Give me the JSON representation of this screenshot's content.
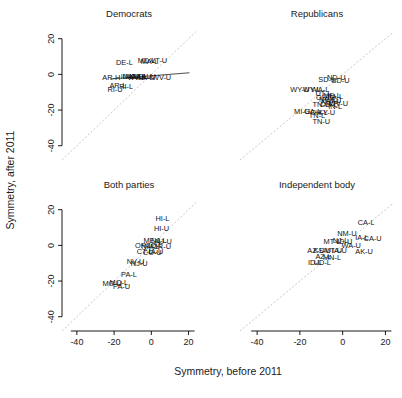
{
  "figure": {
    "axis_titles": {
      "x": "Symmetry, before 2011",
      "y": "Symmetry, after 2011"
    },
    "panel_titles": [
      "Democrats",
      "Republicans",
      "Both parties",
      "Independent body"
    ]
  },
  "chart_data": {
    "type": "scatter",
    "title": "",
    "subtitle": "",
    "xlabel": "Symmetry, before 2011",
    "ylabel": "Symmetry, after 2011",
    "xlim": [
      -48,
      24
    ],
    "ylim": [
      -48,
      26
    ],
    "xticks": [
      -40,
      -20,
      0,
      20
    ],
    "yticks": [
      -40,
      -20,
      0,
      20
    ],
    "xtick_labels": [
      "-40",
      "-20",
      "0",
      "20"
    ],
    "ytick_labels": [
      "-40",
      "-20",
      "0",
      "20"
    ],
    "grid": false,
    "legend": "none",
    "layout": "2x2 facet grid",
    "reference_line": {
      "type": "identity",
      "description": "y = x dashed grey diagonal",
      "color": "#b9b9b9"
    },
    "panels": [
      {
        "name": "Democrats",
        "fit_line": {
          "present": true,
          "x0": -22.0,
          "y0": -2.6,
          "x1": 20.5,
          "y1": 0.9,
          "color": "#3a3a3a"
        },
        "points": [
          {
            "label": "DE-L",
            "x": -14.5,
            "y": 5.0
          },
          {
            "label": "MD-L",
            "x": -2.5,
            "y": 6.2
          },
          {
            "label": "MA-L",
            "x": -1.0,
            "y": 6.0
          },
          {
            "label": "VT-U",
            "x": 4.0,
            "y": 6.4
          },
          {
            "label": "AR-H",
            "x": -21.5,
            "y": -3.4
          },
          {
            "label": "IL-L",
            "x": -13.0,
            "y": -2.6
          },
          {
            "label": "NV-L",
            "x": -11.0,
            "y": -2.4
          },
          {
            "label": "MA-U",
            "x": -9.0,
            "y": -2.6
          },
          {
            "label": "WV-L",
            "x": -8.0,
            "y": -3.0
          },
          {
            "label": "CA-L",
            "x": -6.5,
            "y": -2.8
          },
          {
            "label": "MD-U",
            "x": -5.0,
            "y": -2.6
          },
          {
            "label": "LA-L",
            "x": -3.0,
            "y": -3.0
          },
          {
            "label": "IL-U",
            "x": -1.5,
            "y": -2.4
          },
          {
            "label": "WV-U",
            "x": 5.5,
            "y": -3.4
          },
          {
            "label": "AR-L",
            "x": -18.0,
            "y": -7.4
          },
          {
            "label": "RI-L",
            "x": -13.5,
            "y": -8.0
          },
          {
            "label": "RI-U",
            "x": -19.5,
            "y": -9.6
          }
        ]
      },
      {
        "name": "Republicans",
        "fit_line": {
          "present": false
        },
        "points": [
          {
            "label": "ND-U",
            "x": -3.0,
            "y": -3.2
          },
          {
            "label": "SD-L",
            "x": -7.5,
            "y": -4.0
          },
          {
            "label": "SD-U",
            "x": -1.0,
            "y": -5.0
          },
          {
            "label": "WY-U",
            "x": -20.0,
            "y": -10.0
          },
          {
            "label": "WY-L",
            "x": -14.5,
            "y": -10.0
          },
          {
            "label": "WA-L",
            "x": -10.5,
            "y": -10.0
          },
          {
            "label": "UT-L",
            "x": -9.0,
            "y": -12.0
          },
          {
            "label": "OH-U",
            "x": -8.0,
            "y": -14.5
          },
          {
            "label": "ME-L",
            "x": -5.0,
            "y": -13.5
          },
          {
            "label": "PA-L",
            "x": -3.5,
            "y": -14.0
          },
          {
            "label": "NC-L",
            "x": -7.0,
            "y": -15.5
          },
          {
            "label": "KS-U",
            "x": -6.0,
            "y": -16.5
          },
          {
            "label": "WI-U",
            "x": -4.5,
            "y": -16.0
          },
          {
            "label": "WV-U",
            "x": -2.0,
            "y": -17.5
          },
          {
            "label": "TN-U",
            "x": -10.0,
            "y": -18.5
          },
          {
            "label": "OH-L",
            "x": -6.5,
            "y": -18.5
          },
          {
            "label": "IN-L",
            "x": -3.5,
            "y": -19.5
          },
          {
            "label": "MI-U",
            "x": -19.0,
            "y": -22.0
          },
          {
            "label": "GA-L",
            "x": -14.0,
            "y": -22.0
          },
          {
            "label": "OH-L2",
            "x": -11.0,
            "y": -22.5
          },
          {
            "label": "KY-U",
            "x": -7.5,
            "y": -22.5
          },
          {
            "label": "TN-L",
            "x": -12.0,
            "y": -24.5
          },
          {
            "label": "TN-U2",
            "x": -10.0,
            "y": -28.0
          }
        ]
      },
      {
        "name": "Both parties",
        "fit_line": {
          "present": false
        },
        "points": [
          {
            "label": "HI-L",
            "x": 6.0,
            "y": 13.5
          },
          {
            "label": "HI-U",
            "x": 5.5,
            "y": 8.0
          },
          {
            "label": "ME-L",
            "x": 0.5,
            "y": 1.5
          },
          {
            "label": "NJ-L",
            "x": 4.0,
            "y": 1.5
          },
          {
            "label": "NJ-U",
            "x": 6.5,
            "y": 0.6
          },
          {
            "label": "OR-L",
            "x": -4.0,
            "y": -1.5
          },
          {
            "label": "NM-L",
            "x": -0.5,
            "y": -1.8
          },
          {
            "label": "CO-L",
            "x": 1.5,
            "y": -1.6
          },
          {
            "label": "OR-U",
            "x": 5.5,
            "y": -1.8
          },
          {
            "label": "CT-L",
            "x": -3.5,
            "y": -5.0
          },
          {
            "label": "CO-U",
            "x": 0.5,
            "y": -5.2
          },
          {
            "label": "IA-U",
            "x": 2.5,
            "y": -5.0
          },
          {
            "label": "NV-U",
            "x": -8.5,
            "y": -10.5
          },
          {
            "label": "NJ-U2",
            "x": -6.5,
            "y": -11.5
          },
          {
            "label": "PA-L",
            "x": -12.0,
            "y": -17.5
          },
          {
            "label": "MO-U",
            "x": -21.0,
            "y": -22.5
          },
          {
            "label": "MO-L",
            "x": -17.5,
            "y": -22.0
          },
          {
            "label": "PA-U",
            "x": -16.0,
            "y": -24.5
          }
        ]
      },
      {
        "name": "Independent body",
        "fit_line": {
          "present": false
        },
        "points": [
          {
            "label": "CA-L",
            "x": 11.0,
            "y": 11.5
          },
          {
            "label": "NM-U",
            "x": 2.0,
            "y": 5.0
          },
          {
            "label": "CA-U",
            "x": 14.0,
            "y": 2.5
          },
          {
            "label": "IA-L",
            "x": 9.0,
            "y": 3.0
          },
          {
            "label": "MT-L",
            "x": -5.0,
            "y": 1.0
          },
          {
            "label": "NJ-L",
            "x": -1.0,
            "y": 1.5
          },
          {
            "label": "ID-U",
            "x": 1.0,
            "y": 0.5
          },
          {
            "label": "WA-U",
            "x": 4.0,
            "y": -1.5
          },
          {
            "label": "AZ-U",
            "x": -12.5,
            "y": -4.5
          },
          {
            "label": "KS-U",
            "x": -9.5,
            "y": -4.5
          },
          {
            "label": "MT-U",
            "x": -4.5,
            "y": -4.0
          },
          {
            "label": "IA-U",
            "x": -1.5,
            "y": -4.5
          },
          {
            "label": "AK-U",
            "x": 10.0,
            "y": -5.0
          },
          {
            "label": "AZ-L",
            "x": -9.0,
            "y": -7.5
          },
          {
            "label": "MN-L",
            "x": -5.0,
            "y": -8.0
          },
          {
            "label": "ID-L",
            "x": -13.0,
            "y": -11.0
          },
          {
            "label": "UD-L",
            "x": -9.5,
            "y": -11.0
          }
        ]
      }
    ]
  }
}
